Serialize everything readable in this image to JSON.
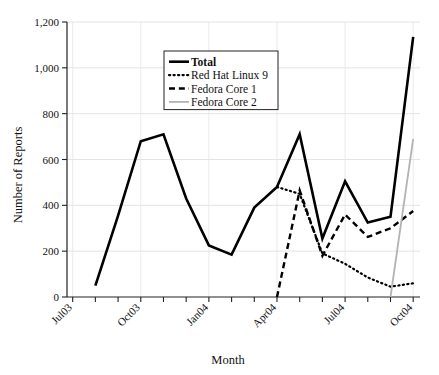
{
  "chart_data": {
    "type": "line",
    "title": "",
    "xlabel": "Month",
    "ylabel": "Number of Reports",
    "ylim": [
      0,
      1200
    ],
    "yticks": [
      0,
      200,
      400,
      600,
      800,
      1000,
      1200
    ],
    "ytick_labels": [
      "0",
      "200",
      "400",
      "600",
      "800",
      "1,000",
      "1,200"
    ],
    "grid": true,
    "legend_position": "upper-center",
    "x": [
      "Jul03",
      "Aug03",
      "Sep03",
      "Oct03",
      "Nov03",
      "Dec03",
      "Jan04",
      "Feb04",
      "Mar04",
      "Apr04",
      "May04",
      "Jun04",
      "Jul04",
      "Aug04",
      "Sep04",
      "Oct04"
    ],
    "xtick_labels": [
      "Jul03",
      "",
      "",
      "Oct03",
      "",
      "",
      "Jan04",
      "",
      "",
      "Apr04",
      "",
      "",
      "Jul04",
      "",
      "",
      "Oct04"
    ],
    "series": [
      {
        "name": "Total",
        "style": "solid",
        "color": "#000000",
        "width": 2.6,
        "x": [
          "Aug03",
          "Sep03",
          "Oct03",
          "Nov03",
          "Dec03",
          "Jan04",
          "Feb04",
          "Mar04",
          "Apr04",
          "May04",
          "Jun04",
          "Jul04",
          "Aug04",
          "Sep04",
          "Oct04"
        ],
        "values": [
          50,
          355,
          680,
          710,
          430,
          225,
          185,
          390,
          480,
          710,
          255,
          505,
          325,
          350,
          1135
        ]
      },
      {
        "name": "Red Hat Linux 9",
        "style": "dotted",
        "color": "#000000",
        "width": 2.2,
        "x": [
          "Apr04",
          "May04",
          "Jun04",
          "Jul04",
          "Aug04",
          "Sep04",
          "Oct04"
        ],
        "values": [
          480,
          450,
          190,
          145,
          85,
          45,
          60
        ]
      },
      {
        "name": "Fedora Core 1",
        "style": "dashed",
        "color": "#000000",
        "width": 2.4,
        "x": [
          "Apr04",
          "May04",
          "Jun04",
          "Jul04",
          "Aug04",
          "Sep04",
          "Oct04"
        ],
        "values": [
          0,
          465,
          180,
          360,
          262,
          300,
          375
        ]
      },
      {
        "name": "Fedora Core 2",
        "style": "solid",
        "color": "#b3b3b3",
        "width": 1.8,
        "x": [
          "Sep04",
          "Oct04"
        ],
        "values": [
          0,
          690
        ]
      }
    ]
  },
  "legend": {
    "items": [
      {
        "label": "Total",
        "style": "solid",
        "color": "#000000",
        "bold": true
      },
      {
        "label": "Red Hat Linux 9",
        "style": "dotted",
        "color": "#000000",
        "bold": false
      },
      {
        "label": "Fedora Core 1",
        "style": "dashed",
        "color": "#000000",
        "bold": false
      },
      {
        "label": "Fedora Core 2",
        "style": "solid",
        "color": "#b3b3b3",
        "bold": false
      }
    ]
  },
  "axes": {
    "y_title": "Number of Reports",
    "x_title": "Month"
  }
}
